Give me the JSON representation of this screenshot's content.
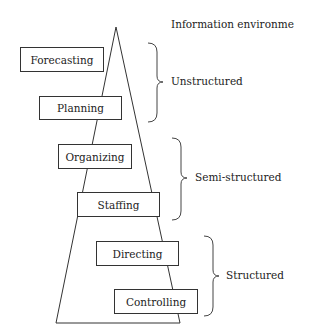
{
  "title": "Information environment",
  "functions": [
    {
      "label": "Forecasting",
      "x": 20,
      "y": 47,
      "w": 84,
      "h": 25
    },
    {
      "label": "Planning",
      "x": 39,
      "y": 96,
      "w": 83,
      "h": 24
    },
    {
      "label": "Organizing",
      "x": 58,
      "y": 144,
      "w": 74,
      "h": 25
    },
    {
      "label": "Staffing",
      "x": 77,
      "y": 192,
      "w": 83,
      "h": 25
    },
    {
      "label": "Directing",
      "x": 96,
      "y": 241,
      "w": 83,
      "h": 25
    },
    {
      "label": "Controlling",
      "x": 114,
      "y": 289,
      "w": 84,
      "h": 25
    }
  ],
  "environments": [
    {
      "label": "Unstructured"
    },
    {
      "label": "Semi-structured"
    },
    {
      "label": "Structured"
    }
  ]
}
